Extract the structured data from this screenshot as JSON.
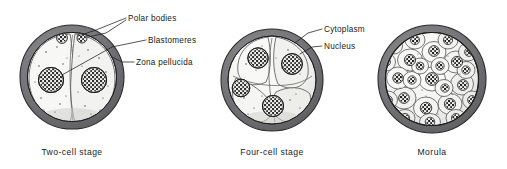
{
  "figure": {
    "background_color": "#ffffff",
    "width": 507,
    "height": 169,
    "signature": "ANVL"
  },
  "palette": {
    "zona_outer": "#6e6e70",
    "zona_inner": "#9a9a9c",
    "zona_stroke": "#2b2b2d",
    "cytoplasm_fill": "#f4f4f2",
    "cytoplasm_shadow": "#d9d9d6",
    "cell_outline": "#4a4a4c",
    "nucleus_dark": "#1c1c1e",
    "nucleus_light": "#fbfbfa",
    "granule": "#3a3a3c",
    "leader_line": "#1d1e20",
    "text": "#17181a"
  },
  "labels": [
    {
      "id": "polar-bodies",
      "text": "Polar bodies",
      "x": 128,
      "y": 20,
      "anchor": "start"
    },
    {
      "id": "blastomeres",
      "text": "Blastomeres",
      "x": 148,
      "y": 41,
      "anchor": "start"
    },
    {
      "id": "zona-pellucida",
      "text": "Zona pellucida",
      "x": 136,
      "y": 64,
      "anchor": "start"
    },
    {
      "id": "cytoplasm",
      "text": "Cytoplasm",
      "x": 324,
      "y": 31,
      "anchor": "start"
    },
    {
      "id": "nucleus",
      "text": "Nucleus",
      "x": 324,
      "y": 48,
      "anchor": "start"
    }
  ],
  "captions": [
    {
      "id": "caption-two-cell",
      "text": "Two-cell stage",
      "x": 72,
      "y": 155
    },
    {
      "id": "caption-four-cell",
      "text": "Four-cell stage",
      "x": 272,
      "y": 155
    },
    {
      "id": "caption-morula",
      "text": "Morula",
      "x": 432,
      "y": 155
    }
  ],
  "stages": [
    {
      "id": "two-cell-stage",
      "name": "Two-cell stage",
      "cell_count": 2,
      "center": {
        "x": 72,
        "y": 77
      },
      "outer_radius": 52,
      "zona_thickness": 7,
      "has_polar_bodies": true,
      "polar_body_count": 2,
      "nucleus_count": 2
    },
    {
      "id": "four-cell-stage",
      "name": "Four-cell stage",
      "cell_count": 4,
      "center": {
        "x": 272,
        "y": 80
      },
      "outer_radius": 51,
      "zona_thickness": 6.5,
      "has_polar_bodies": false,
      "polar_body_count": 0,
      "nucleus_count": 4
    },
    {
      "id": "morula",
      "name": "Morula",
      "cell_count": 24,
      "center": {
        "x": 432,
        "y": 79
      },
      "outer_radius": 54,
      "zona_thickness": 7,
      "has_polar_bodies": false,
      "polar_body_count": 0,
      "nucleus_count": 24
    }
  ],
  "leader_lines": {
    "polar_bodies": [
      {
        "points": "126,18 96,30 78,36"
      },
      {
        "points": "126,20 106,32 88,37"
      }
    ],
    "blastomeres": [
      {
        "points": "146,40 112,46 62,74"
      }
    ],
    "zona_pellucida": [
      {
        "points": "134,62 122,62 112,58"
      }
    ],
    "cytoplasm": [
      {
        "points": "322,30 308,34 296,43"
      }
    ],
    "nucleus": [
      {
        "points": "322,47 312,48 301,53"
      }
    ]
  }
}
